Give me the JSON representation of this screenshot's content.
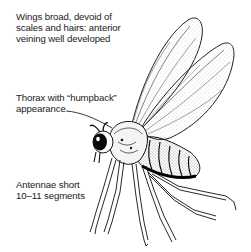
{
  "figure": {
    "annotations": [
      {
        "id": "wings",
        "lines": [
          "Wings broad, devoid of",
          "scales and hairs: anterior",
          "veining well developed"
        ]
      },
      {
        "id": "thorax",
        "lines": [
          "Thorax with “humpback”",
          "appearance"
        ]
      },
      {
        "id": "antennae",
        "lines": [
          "Antennae short",
          "10–11 segments"
        ]
      }
    ]
  }
}
